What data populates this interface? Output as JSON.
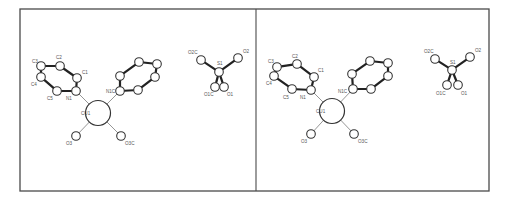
{
  "figure": {
    "type": "stereo-pair molecular structure diagram",
    "panels": [
      {
        "id": "left",
        "offset_x": 0,
        "atoms": [
          {
            "id": "C3",
            "label": "C3",
            "x": 41,
            "y": 66,
            "r": 4.3,
            "lx": 32,
            "ly": 63
          },
          {
            "id": "C2",
            "label": "C2",
            "x": 60,
            "y": 66,
            "r": 4.3,
            "lx": 56,
            "ly": 59
          },
          {
            "id": "C1",
            "label": "C1",
            "x": 77,
            "y": 78,
            "r": 4.3,
            "lx": 82,
            "ly": 74
          },
          {
            "id": "N1",
            "label": "N1",
            "x": 76,
            "y": 91,
            "r": 4.3,
            "lx": 66,
            "ly": 100
          },
          {
            "id": "C5",
            "label": "C5",
            "x": 57,
            "y": 91,
            "r": 4.3,
            "lx": 47,
            "ly": 100
          },
          {
            "id": "C4",
            "label": "C4",
            "x": 41,
            "y": 77,
            "r": 4.3,
            "lx": 31,
            "ly": 86
          },
          {
            "id": "N1C",
            "label": "N1C",
            "x": 120,
            "y": 91,
            "r": 4.3,
            "lx": 106,
            "ly": 93
          },
          {
            "id": "R2a",
            "label": "",
            "x": 120,
            "y": 76,
            "r": 4.3
          },
          {
            "id": "R2b",
            "label": "",
            "x": 139,
            "y": 62,
            "r": 4.3
          },
          {
            "id": "R2c",
            "label": "",
            "x": 157,
            "y": 64,
            "r": 4.3
          },
          {
            "id": "R2d",
            "label": "",
            "x": 155,
            "y": 77,
            "r": 4.3
          },
          {
            "id": "R2e",
            "label": "",
            "x": 138,
            "y": 90,
            "r": 4.3
          },
          {
            "id": "Cu1",
            "label": "CU1",
            "x": 98,
            "y": 113,
            "r": 12.5,
            "lx": 81,
            "ly": 115,
            "metal": true
          },
          {
            "id": "O3",
            "label": "O3",
            "x": 76,
            "y": 136,
            "r": 4.3,
            "lx": 66,
            "ly": 145
          },
          {
            "id": "O3C",
            "label": "O3C",
            "x": 121,
            "y": 136,
            "r": 4.3,
            "lx": 125,
            "ly": 145
          },
          {
            "id": "O2C",
            "label": "O2C",
            "x": 201,
            "y": 60,
            "r": 4.3,
            "lx": 188,
            "ly": 54
          },
          {
            "id": "O2",
            "label": "O2",
            "x": 238,
            "y": 58,
            "r": 4.3,
            "lx": 243,
            "ly": 53
          },
          {
            "id": "S1",
            "label": "S1",
            "x": 219,
            "y": 72,
            "r": 4.3,
            "lx": 217,
            "ly": 65
          },
          {
            "id": "O1C",
            "label": "O1C",
            "x": 215,
            "y": 87,
            "r": 4.3,
            "lx": 204,
            "ly": 96
          },
          {
            "id": "O1",
            "label": "O1",
            "x": 224,
            "y": 87,
            "r": 4.3,
            "lx": 227,
            "ly": 96
          }
        ]
      },
      {
        "id": "right",
        "offset_x": 0,
        "atoms": [
          {
            "id": "C3",
            "label": "C3",
            "x": 277,
            "y": 67,
            "r": 4.3,
            "lx": 268,
            "ly": 63
          },
          {
            "id": "C2",
            "label": "C2",
            "x": 297,
            "y": 64,
            "r": 4.3,
            "lx": 292,
            "ly": 58
          },
          {
            "id": "C1",
            "label": "C1",
            "x": 314,
            "y": 77,
            "r": 4.3,
            "lx": 318,
            "ly": 72
          },
          {
            "id": "N1",
            "label": "N1",
            "x": 311,
            "y": 90,
            "r": 4.3,
            "lx": 300,
            "ly": 99
          },
          {
            "id": "C5",
            "label": "C5",
            "x": 292,
            "y": 89,
            "r": 4.3,
            "lx": 283,
            "ly": 99
          },
          {
            "id": "C4",
            "label": "C4",
            "x": 274,
            "y": 76,
            "r": 4.3,
            "lx": 266,
            "ly": 85
          },
          {
            "id": "N1C",
            "label": "N1C",
            "x": 353,
            "y": 89,
            "r": 4.3,
            "lx": 338,
            "ly": 93
          },
          {
            "id": "R2a",
            "label": "",
            "x": 352,
            "y": 74,
            "r": 4.3
          },
          {
            "id": "R2b",
            "label": "",
            "x": 370,
            "y": 61,
            "r": 4.3
          },
          {
            "id": "R2c",
            "label": "",
            "x": 388,
            "y": 63,
            "r": 4.3
          },
          {
            "id": "R2d",
            "label": "",
            "x": 388,
            "y": 76,
            "r": 4.3
          },
          {
            "id": "R2e",
            "label": "",
            "x": 371,
            "y": 89,
            "r": 4.3
          },
          {
            "id": "Cu1",
            "label": "CU1",
            "x": 332,
            "y": 111,
            "r": 12.5,
            "lx": 316,
            "ly": 113,
            "metal": true
          },
          {
            "id": "O3",
            "label": "O3",
            "x": 311,
            "y": 134,
            "r": 4.3,
            "lx": 301,
            "ly": 143
          },
          {
            "id": "O3C",
            "label": "O3C",
            "x": 354,
            "y": 134,
            "r": 4.3,
            "lx": 358,
            "ly": 143
          },
          {
            "id": "O2C",
            "label": "O2C",
            "x": 435,
            "y": 59,
            "r": 4.3,
            "lx": 424,
            "ly": 53
          },
          {
            "id": "O2",
            "label": "O2",
            "x": 470,
            "y": 57,
            "r": 4.3,
            "lx": 475,
            "ly": 52
          },
          {
            "id": "S1",
            "label": "S1",
            "x": 452,
            "y": 70,
            "r": 4.3,
            "lx": 450,
            "ly": 64
          },
          {
            "id": "O1C",
            "label": "O1C",
            "x": 447,
            "y": 85,
            "r": 4.3,
            "lx": 436,
            "ly": 95
          },
          {
            "id": "O1",
            "label": "O1",
            "x": 458,
            "y": 85,
            "r": 4.3,
            "lx": 461,
            "ly": 95
          }
        ]
      }
    ],
    "bonds_thick": [
      [
        "C3",
        "C2"
      ],
      [
        "C2",
        "C1"
      ],
      [
        "C1",
        "N1"
      ],
      [
        "N1",
        "C5"
      ],
      [
        "C5",
        "C4"
      ],
      [
        "C4",
        "C3"
      ],
      [
        "N1C",
        "R2a"
      ],
      [
        "R2a",
        "R2b"
      ],
      [
        "R2b",
        "R2c"
      ],
      [
        "R2c",
        "R2d"
      ],
      [
        "R2d",
        "R2e"
      ],
      [
        "R2e",
        "N1C"
      ],
      [
        "O2C",
        "S1"
      ],
      [
        "O2",
        "S1"
      ],
      [
        "S1",
        "O1C"
      ],
      [
        "S1",
        "O1"
      ]
    ],
    "bonds_thin": [
      [
        "N1",
        "Cu1"
      ],
      [
        "N1C",
        "Cu1"
      ],
      [
        "O3",
        "Cu1"
      ],
      [
        "O3C",
        "Cu1"
      ]
    ],
    "frame": {
      "x": 20,
      "y": 9,
      "width": 469,
      "height": 182,
      "divider_x": 256
    },
    "colors": {
      "line": "#4a4a4a",
      "bond": "#222222",
      "coord_bond": "#8a8a8a",
      "atom_fill": "#ffffff",
      "label": "#555555"
    }
  }
}
